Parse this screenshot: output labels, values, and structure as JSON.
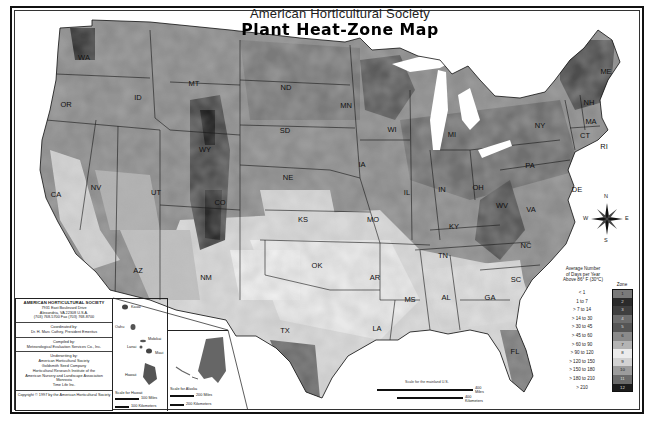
{
  "title": {
    "organization": "American Horticultural Society",
    "map_title": "Plant Heat-Zone Map"
  },
  "state_labels": [
    {
      "abbr": "WA",
      "x": 84,
      "y": 60
    },
    {
      "abbr": "OR",
      "x": 66,
      "y": 107
    },
    {
      "abbr": "CA",
      "x": 56,
      "y": 197
    },
    {
      "abbr": "NV",
      "x": 96,
      "y": 190
    },
    {
      "abbr": "ID",
      "x": 138,
      "y": 100
    },
    {
      "abbr": "MT",
      "x": 194,
      "y": 86
    },
    {
      "abbr": "WY",
      "x": 205,
      "y": 152
    },
    {
      "abbr": "UT",
      "x": 156,
      "y": 195
    },
    {
      "abbr": "AZ",
      "x": 138,
      "y": 273
    },
    {
      "abbr": "NM",
      "x": 206,
      "y": 280
    },
    {
      "abbr": "CO",
      "x": 220,
      "y": 205
    },
    {
      "abbr": "ND",
      "x": 286,
      "y": 90
    },
    {
      "abbr": "SD",
      "x": 285,
      "y": 133
    },
    {
      "abbr": "NE",
      "x": 288,
      "y": 180
    },
    {
      "abbr": "KS",
      "x": 303,
      "y": 222
    },
    {
      "abbr": "OK",
      "x": 317,
      "y": 268
    },
    {
      "abbr": "TX",
      "x": 285,
      "y": 333
    },
    {
      "abbr": "MN",
      "x": 346,
      "y": 108
    },
    {
      "abbr": "IA",
      "x": 362,
      "y": 167
    },
    {
      "abbr": "MO",
      "x": 373,
      "y": 222
    },
    {
      "abbr": "AR",
      "x": 375,
      "y": 280
    },
    {
      "abbr": "LA",
      "x": 377,
      "y": 331
    },
    {
      "abbr": "WI",
      "x": 392,
      "y": 132
    },
    {
      "abbr": "IL",
      "x": 407,
      "y": 195
    },
    {
      "abbr": "MS",
      "x": 410,
      "y": 302
    },
    {
      "abbr": "MI",
      "x": 452,
      "y": 137
    },
    {
      "abbr": "IN",
      "x": 442,
      "y": 192
    },
    {
      "abbr": "KY",
      "x": 454,
      "y": 229
    },
    {
      "abbr": "TN",
      "x": 443,
      "y": 258
    },
    {
      "abbr": "AL",
      "x": 446,
      "y": 300
    },
    {
      "abbr": "GA",
      "x": 490,
      "y": 300
    },
    {
      "abbr": "FL",
      "x": 515,
      "y": 354
    },
    {
      "abbr": "OH",
      "x": 478,
      "y": 190
    },
    {
      "abbr": "WV",
      "x": 502,
      "y": 208
    },
    {
      "abbr": "VA",
      "x": 531,
      "y": 212
    },
    {
      "abbr": "NC",
      "x": 526,
      "y": 248
    },
    {
      "abbr": "SC",
      "x": 516,
      "y": 282
    },
    {
      "abbr": "PA",
      "x": 530,
      "y": 168
    },
    {
      "abbr": "NY",
      "x": 540,
      "y": 128
    },
    {
      "abbr": "ME",
      "x": 606,
      "y": 74
    },
    {
      "abbr": "NH",
      "x": 589,
      "y": 105
    },
    {
      "abbr": "MA",
      "x": 591,
      "y": 124
    },
    {
      "abbr": "CT",
      "x": 585,
      "y": 138
    },
    {
      "abbr": "RI",
      "x": 604,
      "y": 149
    },
    {
      "abbr": "DE",
      "x": 577,
      "y": 192
    }
  ],
  "info_panel": {
    "org_name": "AMERICAN HORTICULTURAL SOCIETY",
    "address_line1": "7931 East Boulevard Drive",
    "address_line2": "Alexandria, VA 22308 U.S.A.",
    "phone": "(703) 768-5700 Fax (703) 768-8700",
    "coordinated_label": "Coordinated by:",
    "coordinated_by": "Dr. H. Marc Cathey, President Emeritus",
    "compiled_label": "Compiled by:",
    "compiled_by": "Meteorological Evaluation Services Co., Inc.",
    "underwriting_label": "Underwriting by:",
    "underwriters": [
      "American Horticultural Society",
      "Goldsmith Seed Company",
      "Horticultural Research Institute of the",
      "American Nursery and Landscape Association",
      "Monrovia",
      "Time Life Inc."
    ],
    "copyright": "Copyright © 1997 by the American Horticultural Society"
  },
  "hawaii_inset": {
    "islands": [
      "Kauai",
      "Oahu",
      "Molokai",
      "Lanai",
      "Maui",
      "Hawaii"
    ],
    "scale_label": "Scale for Hawaii",
    "scale_miles": "100 Miles",
    "scale_km": "100 Kilometers"
  },
  "alaska_inset": {
    "scale_label": "Scale for Alaska",
    "scale_miles": "200 Miles",
    "scale_km": "200 Kilometers"
  },
  "mainland_scale": {
    "label": "Scale for the mainland U.S.",
    "miles": "400 Miles",
    "km": "400 Kilometers"
  },
  "compass": {
    "n": "N",
    "s": "S",
    "e": "E",
    "w": "W"
  },
  "legend": {
    "title_line1": "Average Number",
    "title_line2": "of Days per Year",
    "title_line3": "Above 86° F (30°C)",
    "zone_header": "Zone",
    "rows": [
      {
        "range": "< 1",
        "zone": "1",
        "color": "#7a7a7a"
      },
      {
        "range": "1 to 7",
        "zone": "2",
        "color": "#2b2b2b"
      },
      {
        "range": "> 7 to 14",
        "zone": "3",
        "color": "#3f3f3f"
      },
      {
        "range": "> 14 to 30",
        "zone": "4",
        "color": "#6d6d6d"
      },
      {
        "range": "> 30 to 45",
        "zone": "5",
        "color": "#555555"
      },
      {
        "range": "> 45 to 60",
        "zone": "6",
        "color": "#8a8a8a"
      },
      {
        "range": "> 60 to 90",
        "zone": "7",
        "color": "#b4b4b4"
      },
      {
        "range": "> 90 to 120",
        "zone": "8",
        "color": "#ececec"
      },
      {
        "range": "> 120 to 150",
        "zone": "9",
        "color": "#d2d2d2"
      },
      {
        "range": "> 150 to 180",
        "zone": "10",
        "color": "#9c9c9c"
      },
      {
        "range": "> 180 to 210",
        "zone": "11",
        "color": "#6a6a6a"
      },
      {
        "range": "> 210",
        "zone": "12",
        "color": "#1c1c1c"
      }
    ]
  },
  "colors": {
    "frame": "#111111",
    "background": "#ffffff",
    "water": "#ffffff",
    "zone_dark": "#4a4a4a",
    "zone_mid": "#858585",
    "zone_light": "#cfcfcf",
    "zone_lightest": "#e6e6e6"
  }
}
